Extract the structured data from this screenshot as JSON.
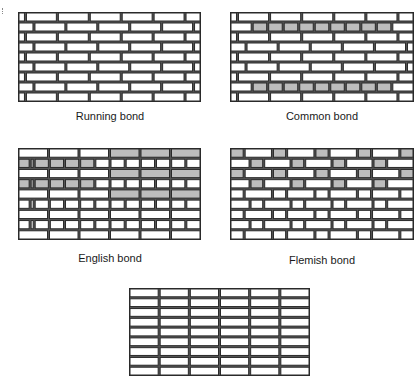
{
  "figure": {
    "panels": [
      {
        "id": "running",
        "caption": "Running bond"
      },
      {
        "id": "common",
        "caption": "Common bond"
      },
      {
        "id": "english",
        "caption": "English bond"
      },
      {
        "id": "flemish",
        "caption": "Flemish bond"
      },
      {
        "id": "stack",
        "caption": ""
      }
    ],
    "colors": {
      "mortar": "#2a2a2a",
      "brick": "#ffffff",
      "header_fill": "#bdbdbd"
    }
  }
}
